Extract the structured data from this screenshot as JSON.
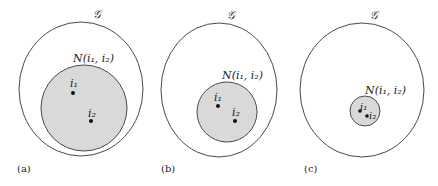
{
  "colors": {
    "stroke": "#4a4a4a",
    "fill": "#d9d9d9",
    "dot": "#111111",
    "background": "#ffffff"
  },
  "panels": [
    {
      "caption": "(a)",
      "outer_label": "𝒢",
      "neighborhood_label": "N(i₁, i₂)",
      "point1_label": "i₁",
      "point2_label": "i₂"
    },
    {
      "caption": "(b)",
      "outer_label": "𝒢",
      "neighborhood_label": "N(i₁, i₂)",
      "point1_label": "i₁",
      "point2_label": "i₂"
    },
    {
      "caption": "(c)",
      "outer_label": "𝒢",
      "neighborhood_label": "N(i₁, i₂)",
      "point1_label": "i₁",
      "point2_label": "i₂"
    }
  ]
}
